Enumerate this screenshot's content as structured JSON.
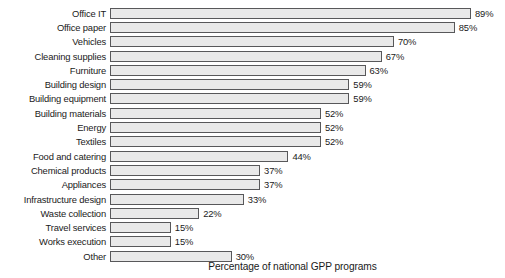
{
  "chart_data": {
    "type": "bar",
    "orientation": "horizontal",
    "title": "",
    "xlabel": "Percentage of national GPP programs",
    "ylabel": "",
    "xlim": [
      0,
      100
    ],
    "grid": false,
    "legend": null,
    "value_suffix": "%",
    "categories": [
      "Office IT",
      "Office paper",
      "Vehicles",
      "Cleaning supplies",
      "Furniture",
      "Building design",
      "Building equipment",
      "Building materials",
      "Energy",
      "Textiles",
      "Food and catering",
      "Chemical products",
      "Appliances",
      "Infrastructure design",
      "Waste collection",
      "Travel services",
      "Works execution",
      "Other"
    ],
    "values": [
      89,
      85,
      70,
      67,
      63,
      59,
      59,
      52,
      52,
      52,
      44,
      37,
      37,
      33,
      22,
      15,
      15,
      30
    ],
    "value_labels": [
      "89%",
      "85%",
      "70%",
      "67%",
      "63%",
      "59%",
      "59%",
      "52%",
      "52%",
      "52%",
      "44%",
      "37%",
      "37%",
      "33%",
      "22%",
      "15%",
      "15%",
      "30%"
    ],
    "bar_fill_color": "#e9e9e9",
    "bar_border_color": "#58585a",
    "text_color": "#1a1a1a",
    "background_color": "#ffffff"
  }
}
